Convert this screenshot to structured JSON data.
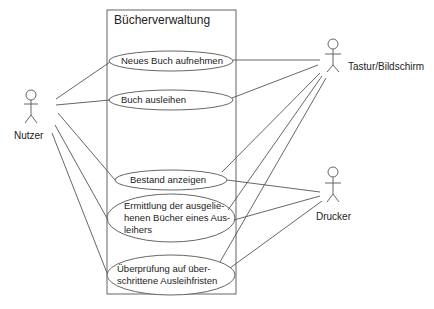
{
  "diagram": {
    "type": "uml-use-case",
    "system": {
      "title": "Bücherverwaltung"
    },
    "actors": [
      {
        "id": "nutzer",
        "label": "Nutzer"
      },
      {
        "id": "tastatur",
        "label": "Tastur/Bildschirm"
      },
      {
        "id": "drucker",
        "label": "Drucker"
      }
    ],
    "use_cases": [
      {
        "id": "uc1",
        "label": "Neues Buch aufnehmen"
      },
      {
        "id": "uc2",
        "label": "Buch ausleihen"
      },
      {
        "id": "uc3",
        "label": "Bestand anzeigen"
      },
      {
        "id": "uc4",
        "label": "Ermittlung der ausgelie-henen Bücher eines Aus-leihers",
        "lines": [
          "Ermittlung der ausgelie-",
          "henen Bücher eines Aus-",
          "leihers"
        ]
      },
      {
        "id": "uc5",
        "label": "Überprüfung auf über-schrittene Ausleihfristen",
        "lines": [
          "Überprüfung auf über-",
          "schrittene Ausleihfristen"
        ]
      }
    ],
    "associations": [
      [
        "nutzer",
        "uc1"
      ],
      [
        "nutzer",
        "uc2"
      ],
      [
        "nutzer",
        "uc3"
      ],
      [
        "nutzer",
        "uc4"
      ],
      [
        "nutzer",
        "uc5"
      ],
      [
        "tastatur",
        "uc1"
      ],
      [
        "tastatur",
        "uc2"
      ],
      [
        "tastatur",
        "uc3"
      ],
      [
        "tastatur",
        "uc4"
      ],
      [
        "tastatur",
        "uc5"
      ],
      [
        "drucker",
        "uc3"
      ],
      [
        "drucker",
        "uc4"
      ],
      [
        "drucker",
        "uc5"
      ]
    ],
    "colors": {
      "line": "#555555",
      "text": "#222222",
      "background": "#ffffff"
    }
  }
}
